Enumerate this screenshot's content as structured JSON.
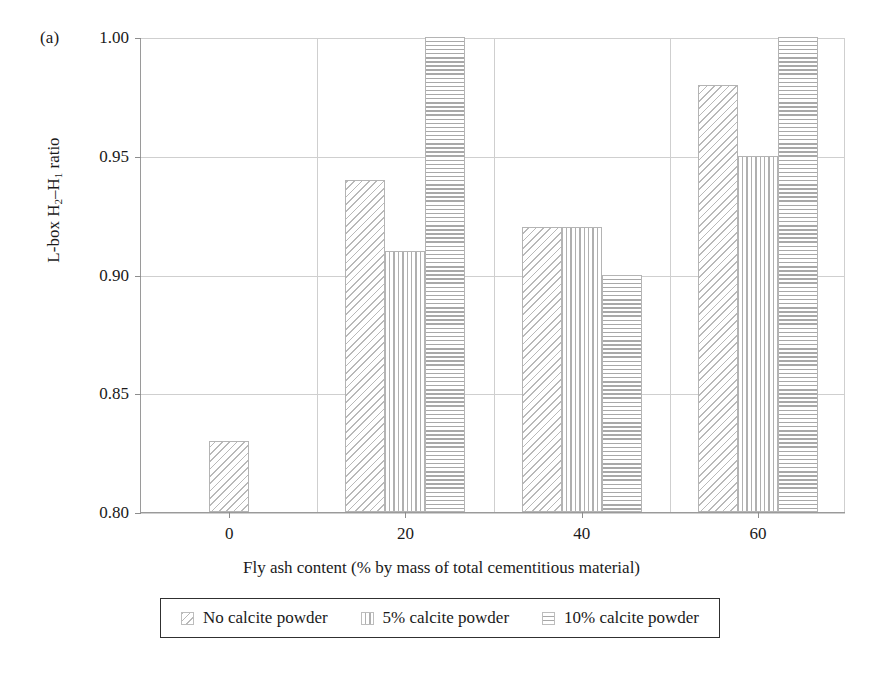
{
  "panel": {
    "label": "(a)"
  },
  "chart_data": {
    "type": "bar",
    "title": "",
    "subtitle": "",
    "panel_label": "(a)",
    "xlabel": "Fly ash content (% by mass of total cementitious material)",
    "ylabel": "L-box H2–H1 ratio",
    "ylabel_parts": {
      "prefix": "L-box H",
      "sub1": "2",
      "dash": "–",
      "mid": "H",
      "sub2": "1",
      "suffix": " ratio"
    },
    "categories": [
      "0",
      "20",
      "40",
      "60"
    ],
    "ylim": [
      0.8,
      1.0
    ],
    "yticks": [
      "0.80",
      "0.85",
      "0.90",
      "0.95",
      "1.00"
    ],
    "ytick_values": [
      0.8,
      0.85,
      0.9,
      0.95,
      1.0
    ],
    "grid": true,
    "legend_position": "bottom",
    "series": [
      {
        "name": "No calcite powder",
        "pattern": "diagonal-hatch",
        "values": [
          0.83,
          0.94,
          0.92,
          0.98
        ]
      },
      {
        "name": "5% calcite powder",
        "pattern": "vertical-lines",
        "values": [
          null,
          0.91,
          0.92,
          0.95
        ]
      },
      {
        "name": "10% calcite powder",
        "pattern": "horizontal-lines",
        "values": [
          null,
          1.0,
          0.9,
          1.0
        ]
      }
    ]
  },
  "legend": {
    "items": [
      {
        "label": "No calcite powder",
        "pattern": "diagonal-hatch"
      },
      {
        "label": "5% calcite powder",
        "pattern": "vertical-lines"
      },
      {
        "label": "10% calcite powder",
        "pattern": "horizontal-lines"
      }
    ]
  },
  "colors": {
    "axis": "#9a9a9a",
    "grid": "#cfcfcf",
    "bar_outline": "#b4b4b4",
    "text": "#1a1a1a",
    "legend_border": "#303030",
    "background": "#ffffff"
  }
}
